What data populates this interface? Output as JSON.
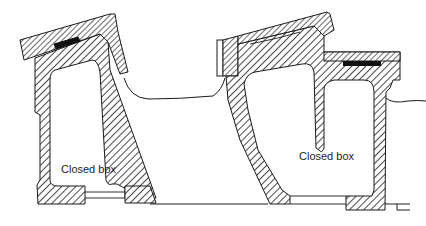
{
  "diagram": {
    "type": "cross-section",
    "labels": {
      "left_box": "Closed box",
      "right_box": "Closed box"
    },
    "colors": {
      "line": "#1a1a1a",
      "fill_solid": "#111111",
      "background": "#ffffff"
    },
    "elements": [
      "left closed box section (hatched)",
      "left sloped cover slab (hatched) with black gasket",
      "flexible membrane between boxes",
      "right closed box section (hatched)",
      "right sloped cover slab with vertical end plate",
      "right flat cover slab (hatched) with black gasket",
      "right flexible membrane",
      "base line"
    ]
  }
}
